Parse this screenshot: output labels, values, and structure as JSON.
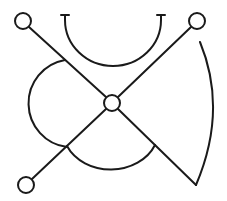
{
  "diagram": {
    "colors": {
      "stroke": "#1a1a1a",
      "background": "#ffffff"
    },
    "nodes": [
      {
        "id": "top-left",
        "cx": 23,
        "cy": 21,
        "r": 8
      },
      {
        "id": "top-right",
        "cx": 197,
        "cy": 21,
        "r": 8
      },
      {
        "id": "center",
        "cx": 112,
        "cy": 103,
        "r": 8
      },
      {
        "id": "bottom-left",
        "cx": 26,
        "cy": 185,
        "r": 8
      }
    ]
  }
}
